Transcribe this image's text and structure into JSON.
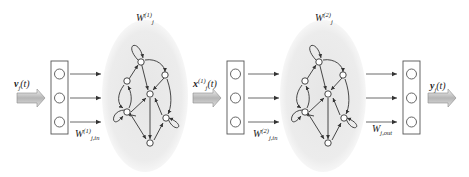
{
  "diagram": {
    "type": "deep-echo-state-network",
    "colors": {
      "line": "#333333",
      "reservoir_fill": "#ebebeb",
      "arrow_fill_light": "#e8e8e8",
      "arrow_fill_dark": "#a8a8a8",
      "box_stroke": "#555555"
    },
    "input_signal": {
      "base": "v",
      "sub": "j",
      "arg": "(t)"
    },
    "layers": [
      {
        "input_layer_label": {
          "base": "W",
          "sub": "j,in",
          "sup": "(1)"
        },
        "reservoir_label": {
          "base": "W",
          "sub": "j",
          "sup": "(1)"
        },
        "neurons": 3,
        "reservoir_nodes": 7
      },
      {
        "intermediate_signal": {
          "base": "x",
          "sub": "j",
          "sup": "(1)",
          "arg": "(t)"
        },
        "input_layer_label": {
          "base": "W",
          "sub": "j,in",
          "sup": "(2)"
        },
        "reservoir_label": {
          "base": "W",
          "sub": "j",
          "sup": "(2)"
        },
        "neurons": 3,
        "reservoir_nodes": 7
      }
    ],
    "output_layer": {
      "weights_label": {
        "base": "W",
        "sub": "j,out"
      },
      "neurons": 3
    },
    "output_signal": {
      "base": "y",
      "sub": "j",
      "arg": "(t)"
    }
  }
}
